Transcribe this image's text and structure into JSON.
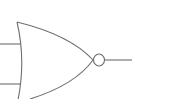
{
  "diagram": {
    "type": "logic-gate",
    "gate": "NOR",
    "inputs": 2,
    "outputs": 1,
    "stroke_color": "#6e6e6e",
    "background_color": "#ffffff"
  }
}
